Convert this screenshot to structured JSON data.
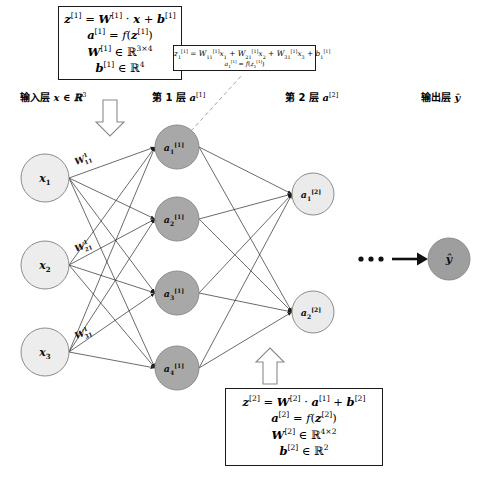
{
  "diagram": {
    "colors": {
      "input_node_fill": "#ededed",
      "hidden_node_fill": "#a8a8a8",
      "layer2_node_fill": "#ebebeb",
      "output_node_fill": "#9e9e9e",
      "node_stroke": "#8c8c8c",
      "edge": "#2b2b2b",
      "dash": "#9a9a9a",
      "box_border": "#1a1a1a",
      "background": "#ffffff"
    }
  },
  "layer_labels": {
    "input": {
      "text": "输入层",
      "math": "x ∈ ℝ³"
    },
    "layer1": {
      "text": "第 1 层",
      "math": "a[1]"
    },
    "layer2": {
      "text": "第 2 层",
      "math": "a[2]"
    },
    "output": {
      "text": "输出层",
      "math": "ŷ"
    }
  },
  "box_layer1": {
    "name": "layer-1-formula-box",
    "lines": [
      "z[1] = W[1] · x + b[1]",
      "a[1] = f(z[1])",
      "W[1] ∈ ℝ3×4",
      "b[1] ∈ ℝ4"
    ]
  },
  "box_layer2": {
    "name": "layer-2-formula-box",
    "lines": [
      "z[2] = W[2] · a[1] + b[2]",
      "a[2] = f(z[2])",
      "W[2] ∈ ℝ4×2",
      "b[2] ∈ ℝ2"
    ]
  },
  "box_neuron": {
    "name": "neuron-detail-box",
    "lines": [
      "z1[1] = W11[1] x1 + W21[1] x2 + W31[1] x3 + b1[1]",
      "a1[1] = f(z1[1])"
    ]
  },
  "nodes": {
    "input": [
      {
        "id": "x1",
        "label": "x",
        "sub": "1",
        "cx": 45,
        "cy": 178,
        "r": 24
      },
      {
        "id": "x2",
        "label": "x",
        "sub": "2",
        "cx": 45,
        "cy": 265,
        "r": 24
      },
      {
        "id": "x3",
        "label": "x",
        "sub": "3",
        "cx": 45,
        "cy": 352,
        "r": 24
      }
    ],
    "hidden": [
      {
        "id": "a1_1",
        "label": "a",
        "sub": "1",
        "sup": "[1]",
        "cx": 177,
        "cy": 147,
        "r": 22
      },
      {
        "id": "a2_1",
        "label": "a",
        "sub": "2",
        "sup": "[1]",
        "cx": 177,
        "cy": 219,
        "r": 22
      },
      {
        "id": "a3_1",
        "label": "a",
        "sub": "3",
        "sup": "[1]",
        "cx": 177,
        "cy": 293,
        "r": 22
      },
      {
        "id": "a4_1",
        "label": "a",
        "sub": "4",
        "sup": "[1]",
        "cx": 177,
        "cy": 368,
        "r": 22
      }
    ],
    "layer2": [
      {
        "id": "a1_2",
        "label": "a",
        "sub": "1",
        "sup": "[2]",
        "cx": 313,
        "cy": 194,
        "r": 21
      },
      {
        "id": "a2_2",
        "label": "a",
        "sub": "2",
        "sup": "[2]",
        "cx": 313,
        "cy": 312,
        "r": 21
      }
    ],
    "output": {
      "id": "yhat",
      "label": "ŷ",
      "cx": 449,
      "cy": 259,
      "r": 21
    }
  },
  "weight_labels": [
    {
      "id": "w11",
      "text": "W",
      "sup": "1",
      "sub": "11",
      "x": 78,
      "y": 163
    },
    {
      "id": "w21",
      "text": "W",
      "sup": "1",
      "sub": "21",
      "x": 78,
      "y": 250
    },
    {
      "id": "w31",
      "text": "W",
      "sup": "1",
      "sub": "31",
      "x": 78,
      "y": 337
    }
  ],
  "annotations": {
    "ellipsis": "•••",
    "down_arrow": "down-block-arrow",
    "up_arrow": "up-block-arrow",
    "flow_arrow": "right-arrow"
  }
}
